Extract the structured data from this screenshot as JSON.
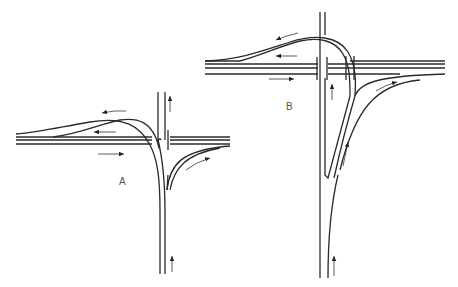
{
  "figure": {
    "labels": [
      {
        "id": "A",
        "text": "A",
        "x": 119,
        "y": 176
      },
      {
        "id": "B",
        "text": "B",
        "x": 286,
        "y": 101
      }
    ],
    "colors": {
      "line": "#2a2a2a",
      "background": "#ffffff",
      "label": "#555555"
    },
    "diagrams": [
      {
        "name": "A",
        "description": "Trumpet-style T-interchange with one loop ramp"
      },
      {
        "name": "B",
        "description": "T-interchange with overpass loop ramp and directional ramps"
      }
    ]
  }
}
